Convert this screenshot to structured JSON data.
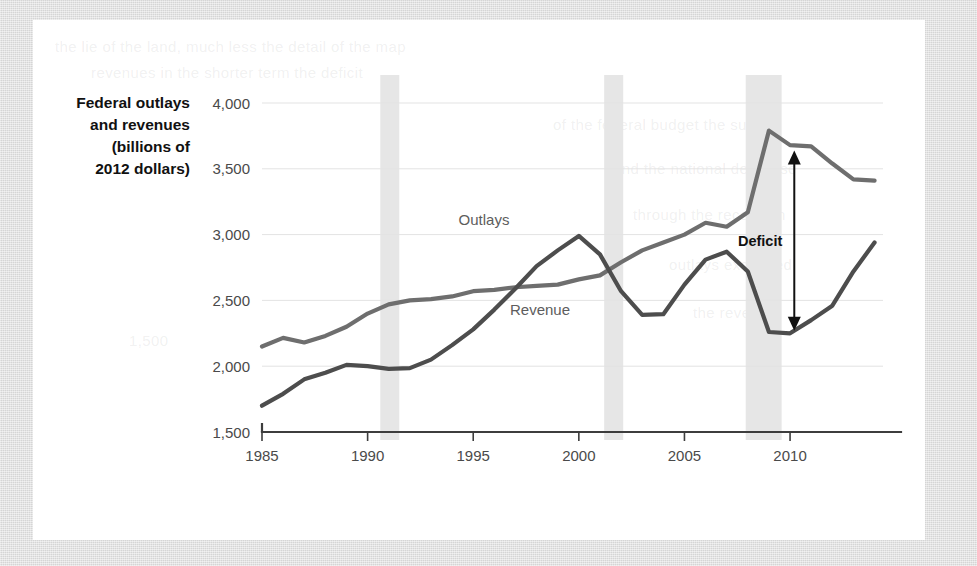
{
  "figure": {
    "y_axis_title_lines": [
      "Federal outlays",
      "and revenues",
      "(billions of",
      "2012 dollars)"
    ],
    "series_labels": {
      "outlays": "Outlays",
      "revenue": "Revenue"
    },
    "annotation": {
      "deficit_label": "Deficit"
    },
    "colors": {
      "outlays_line": "#6e6e6e",
      "revenue_line": "#4d4d4d",
      "recession_band": "#e6e6e6",
      "gridline": "#e3e3e3",
      "axis": "#3d3d3d",
      "panel_background": "#ffffff",
      "page_background": "#d9d9d9",
      "tick_label": "#4a4a4a",
      "title_text": "#111111"
    },
    "ghost_text": [
      "the lie of the land, much less the detail of the map",
      "revenues in the shorter term the deficit",
      "of the federal budget the surplus",
      "and the national debt rose",
      "through the recession",
      "outlays exceeded",
      "the revenue",
      "1,500"
    ]
  },
  "chart_data": {
    "type": "line",
    "title": "",
    "xlabel": "",
    "ylabel": "Federal outlays and revenues (billions of 2012 dollars)",
    "xlim": [
      1985,
      2014
    ],
    "ylim": [
      1500,
      4000
    ],
    "yticks": [
      1500,
      2000,
      2500,
      3000,
      3500,
      4000
    ],
    "ytick_labels": [
      "1,500",
      "2,000",
      "2,500",
      "3,000",
      "3,500",
      "4,000"
    ],
    "xticks": [
      1985,
      1990,
      1995,
      2000,
      2005,
      2010
    ],
    "xtick_labels": [
      "1985",
      "1990",
      "1995",
      "2000",
      "2005",
      "2010"
    ],
    "grid": true,
    "legend": "inline-labels",
    "x": [
      1985,
      1986,
      1987,
      1988,
      1989,
      1990,
      1991,
      1992,
      1993,
      1994,
      1995,
      1996,
      1997,
      1998,
      1999,
      2000,
      2001,
      2002,
      2003,
      2004,
      2005,
      2006,
      2007,
      2008,
      2009,
      2010,
      2011,
      2012,
      2013,
      2014
    ],
    "series": [
      {
        "name": "Outlays",
        "color": "#6e6e6e",
        "values": [
          2150,
          2215,
          2180,
          2230,
          2300,
          2400,
          2470,
          2500,
          2510,
          2530,
          2570,
          2580,
          2600,
          2610,
          2620,
          2660,
          2690,
          2790,
          2880,
          2940,
          3000,
          3090,
          3060,
          3170,
          3790,
          3680,
          3670,
          3540,
          3420,
          3410
        ]
      },
      {
        "name": "Revenue",
        "color": "#4d4d4d",
        "values": [
          1700,
          1790,
          1900,
          1950,
          2010,
          2000,
          1980,
          1985,
          2050,
          2160,
          2280,
          2430,
          2590,
          2760,
          2880,
          2990,
          2850,
          2570,
          2390,
          2395,
          2620,
          2810,
          2870,
          2720,
          2260,
          2250,
          2350,
          2460,
          2720,
          2940
        ]
      }
    ],
    "recession_bands": [
      {
        "start": 1990.6,
        "end": 1991.5
      },
      {
        "start": 2001.2,
        "end": 2002.1
      },
      {
        "start": 2007.9,
        "end": 2009.6
      }
    ],
    "annotations": [
      {
        "label": "Deficit",
        "type": "double-arrow",
        "year": 2010.2,
        "from_value": 2270,
        "to_value": 3640
      }
    ]
  }
}
